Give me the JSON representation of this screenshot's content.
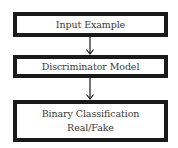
{
  "diagram": {
    "nodes": [
      {
        "id": "input",
        "lines": [
          "Input Example"
        ]
      },
      {
        "id": "discriminator",
        "lines": [
          "Discriminator Model"
        ]
      },
      {
        "id": "output",
        "lines": [
          "Binary Classification",
          "Real/Fake"
        ]
      }
    ],
    "edges": [
      {
        "from": "input",
        "to": "discriminator"
      },
      {
        "from": "discriminator",
        "to": "output"
      }
    ],
    "colors": {
      "border": "#1a1a1a",
      "text": "#3a3a3a",
      "arrow": "#1a1a1a",
      "background": "#ffffff"
    }
  }
}
